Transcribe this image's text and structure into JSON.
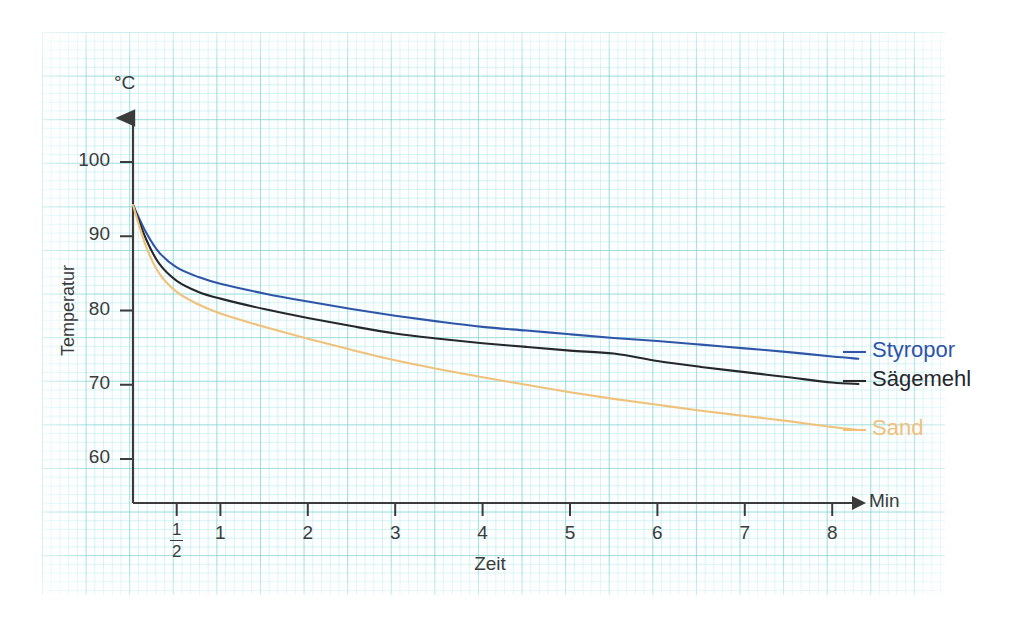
{
  "chart_data": {
    "type": "line",
    "title": "",
    "xlabel": "Zeit",
    "ylabel": "Temperatur",
    "x_unit": "Min",
    "y_unit": "°C",
    "xlim": [
      0,
      8.6
    ],
    "ylim": [
      55,
      104
    ],
    "xticks": [
      0.5,
      1,
      2,
      3,
      4,
      5,
      6,
      7,
      8
    ],
    "xticklabels": [
      "½",
      "1",
      "2",
      "3",
      "4",
      "5",
      "6",
      "7",
      "8"
    ],
    "yticks": [
      60,
      70,
      80,
      90,
      100
    ],
    "yticklabels": [
      "60",
      "70",
      "80",
      "90",
      "100"
    ],
    "grid": true,
    "legend_position": "right",
    "x": [
      0,
      0.15,
      0.3,
      0.5,
      0.75,
      1,
      1.5,
      2,
      2.5,
      3,
      3.5,
      4,
      4.5,
      5,
      5.5,
      6,
      6.5,
      7,
      7.5,
      8,
      8.3
    ],
    "series": [
      {
        "name": "Styropor",
        "color": "#2f55a8",
        "values": [
          94.2,
          90.5,
          87.8,
          85.8,
          84.5,
          83.6,
          82.3,
          81.2,
          80.2,
          79.3,
          78.5,
          77.8,
          77.3,
          76.8,
          76.3,
          75.9,
          75.4,
          74.9,
          74.4,
          73.8,
          73.5
        ]
      },
      {
        "name": "Sägemehl",
        "color": "#25272b",
        "values": [
          94.2,
          89.6,
          86.3,
          84.0,
          82.5,
          81.6,
          80.2,
          79.0,
          77.9,
          76.9,
          76.2,
          75.6,
          75.1,
          74.6,
          74.2,
          73.2,
          72.4,
          71.7,
          71.0,
          70.3,
          70.1
        ]
      },
      {
        "name": "Sand",
        "color": "#f0c17a",
        "values": [
          94.2,
          88.6,
          85.0,
          82.5,
          80.8,
          79.6,
          77.8,
          76.2,
          74.7,
          73.3,
          72.1,
          71.0,
          70.0,
          69.0,
          68.1,
          67.3,
          66.5,
          65.8,
          65.1,
          64.3,
          63.9
        ]
      }
    ],
    "legend": [
      {
        "label": "Styropor",
        "color": "#2f55a8"
      },
      {
        "label": "Sägemehl",
        "color": "#25272b"
      },
      {
        "label": "Sand",
        "color": "#f0c17a"
      }
    ],
    "axis_color": "#3b3b3b",
    "grid_color": "#78cdcd",
    "paper_color": "#fdfeff"
  }
}
